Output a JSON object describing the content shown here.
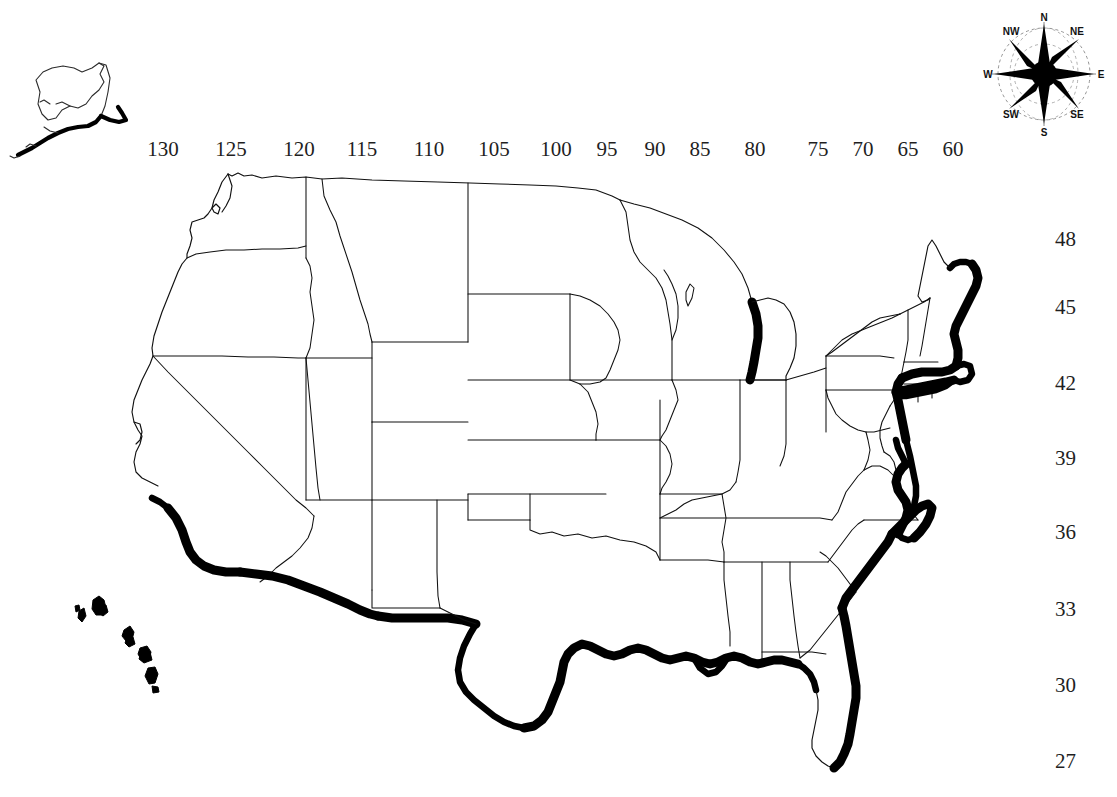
{
  "map": {
    "title": "United States coastal zone map",
    "projection_note": "conterminous United States with Alaska and Hawaii insets",
    "background_color": "#ffffff",
    "line_color": "#101010",
    "highlight_color": "#000000",
    "highlight_meaning": "bold black shoreline emphasis"
  },
  "graticule": {
    "longitude_label_row_y": 148,
    "longitude_labels": [
      {
        "value": "130",
        "x": 163
      },
      {
        "value": "125",
        "x": 231
      },
      {
        "value": "120",
        "x": 299
      },
      {
        "value": "115",
        "x": 362
      },
      {
        "value": "110",
        "x": 429
      },
      {
        "value": "105",
        "x": 494
      },
      {
        "value": "100",
        "x": 556
      },
      {
        "value": "95",
        "x": 607
      },
      {
        "value": "90",
        "x": 655
      },
      {
        "value": "85",
        "x": 700
      },
      {
        "value": "80",
        "x": 755
      },
      {
        "value": "75",
        "x": 818
      },
      {
        "value": "70",
        "x": 863
      },
      {
        "value": "65",
        "x": 908
      },
      {
        "value": "60",
        "x": 953
      }
    ],
    "latitude_labels": [
      {
        "value": "48",
        "y": 237
      },
      {
        "value": "45",
        "y": 305
      },
      {
        "value": "42",
        "y": 381
      },
      {
        "value": "39",
        "y": 456
      },
      {
        "value": "36",
        "y": 530
      },
      {
        "value": "33",
        "y": 607
      },
      {
        "value": "30",
        "y": 683
      },
      {
        "value": "27",
        "y": 759
      }
    ]
  },
  "compass": {
    "name": "compass-rose",
    "cardinal": [
      "N",
      "E",
      "S",
      "W"
    ],
    "intercardinal": [
      "NE",
      "SE",
      "SW",
      "NW"
    ],
    "labels": {
      "n": "N",
      "ne": "NE",
      "e": "E",
      "se": "SE",
      "s": "S",
      "sw": "SW",
      "w": "W",
      "nw": "NW"
    }
  },
  "insets": [
    {
      "name": "alaska",
      "label": "",
      "position": "top-left"
    },
    {
      "name": "hawaii",
      "label": "",
      "position": "left-lower"
    }
  ],
  "highlighted_regions": [
    "Gulf of Mexico coast",
    "Atlantic coast",
    "New England coast",
    "Florida east coast",
    "Lake Michigan east shore",
    "Southern California / Mexico border",
    "Alaska south coast",
    "Hawaiian islands"
  ]
}
